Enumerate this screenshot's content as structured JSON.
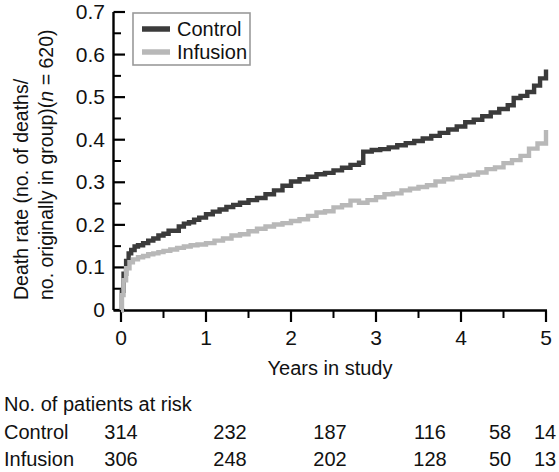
{
  "chart_data": {
    "type": "line",
    "title": "",
    "xlabel": "Years in study",
    "ylabel_line1": "Death rate (no. of deaths/",
    "ylabel_line2_a": "no. originally in group)(",
    "ylabel_line2_italic": "n",
    "ylabel_line2_b": " = 620)",
    "xlim": [
      0,
      5
    ],
    "ylim": [
      0,
      0.7
    ],
    "xticks": [
      0,
      1,
      2,
      3,
      4,
      5
    ],
    "xtick_labels": [
      "0",
      "1",
      "2",
      "3",
      "4",
      "5"
    ],
    "xticks_minor": [
      0.5,
      1.5,
      2.5,
      3.5,
      4.5
    ],
    "yticks": [
      0,
      0.1,
      0.2,
      0.3,
      0.4,
      0.5,
      0.6,
      0.7
    ],
    "ytick_labels": [
      "0",
      "0.1",
      "0.2",
      "0.3",
      "0.4",
      "0.5",
      "0.6",
      "0.7"
    ],
    "yticks_minor": [
      0.05,
      0.15,
      0.25,
      0.35,
      0.45,
      0.55,
      0.65
    ],
    "grid": false,
    "legend_position": "top-left",
    "series": [
      {
        "name": "Control",
        "color": "#3b3b3b",
        "line_width": 4.4,
        "x": [
          0,
          0.01,
          0.03,
          0.06,
          0.09,
          0.12,
          0.16,
          0.2,
          0.26,
          0.32,
          0.38,
          0.44,
          0.5,
          0.56,
          0.62,
          0.68,
          0.74,
          0.8,
          0.86,
          0.92,
          1.0,
          1.08,
          1.16,
          1.24,
          1.32,
          1.4,
          1.5,
          1.6,
          1.7,
          1.8,
          1.9,
          2.0,
          2.1,
          2.2,
          2.3,
          2.4,
          2.5,
          2.6,
          2.7,
          2.8,
          2.85,
          2.95,
          3.05,
          3.15,
          3.25,
          3.35,
          3.45,
          3.55,
          3.65,
          3.75,
          3.85,
          3.95,
          4.05,
          4.15,
          4.25,
          4.35,
          4.45,
          4.55,
          4.62,
          4.7,
          4.78,
          4.86,
          4.93,
          5.0
        ],
        "y": [
          0.0,
          0.045,
          0.085,
          0.115,
          0.133,
          0.141,
          0.149,
          0.152,
          0.157,
          0.163,
          0.168,
          0.175,
          0.179,
          0.186,
          0.186,
          0.196,
          0.203,
          0.206,
          0.212,
          0.217,
          0.225,
          0.231,
          0.236,
          0.242,
          0.247,
          0.252,
          0.258,
          0.263,
          0.272,
          0.281,
          0.292,
          0.302,
          0.307,
          0.313,
          0.319,
          0.322,
          0.328,
          0.334,
          0.341,
          0.346,
          0.372,
          0.376,
          0.378,
          0.382,
          0.387,
          0.392,
          0.397,
          0.403,
          0.409,
          0.416,
          0.424,
          0.431,
          0.441,
          0.447,
          0.455,
          0.464,
          0.472,
          0.481,
          0.498,
          0.503,
          0.512,
          0.527,
          0.544,
          0.565
        ]
      },
      {
        "name": "Infusion",
        "color": "#b8b8b8",
        "line_width": 4.4,
        "x": [
          0,
          0.01,
          0.03,
          0.06,
          0.1,
          0.14,
          0.2,
          0.26,
          0.32,
          0.38,
          0.44,
          0.5,
          0.58,
          0.66,
          0.74,
          0.82,
          0.9,
          1.0,
          1.1,
          1.2,
          1.3,
          1.4,
          1.5,
          1.6,
          1.7,
          1.8,
          1.9,
          2.0,
          2.1,
          2.2,
          2.3,
          2.4,
          2.5,
          2.6,
          2.7,
          2.8,
          2.9,
          3.0,
          3.1,
          3.2,
          3.3,
          3.4,
          3.5,
          3.6,
          3.7,
          3.8,
          3.9,
          4.0,
          4.1,
          4.2,
          4.3,
          4.4,
          4.5,
          4.6,
          4.7,
          4.8,
          4.9,
          5.0
        ],
        "y": [
          0.0,
          0.035,
          0.07,
          0.098,
          0.112,
          0.119,
          0.124,
          0.127,
          0.131,
          0.133,
          0.136,
          0.139,
          0.142,
          0.146,
          0.149,
          0.152,
          0.154,
          0.157,
          0.163,
          0.168,
          0.175,
          0.178,
          0.185,
          0.191,
          0.196,
          0.201,
          0.204,
          0.209,
          0.213,
          0.221,
          0.229,
          0.232,
          0.241,
          0.246,
          0.257,
          0.252,
          0.258,
          0.265,
          0.272,
          0.274,
          0.281,
          0.285,
          0.289,
          0.293,
          0.302,
          0.307,
          0.311,
          0.315,
          0.318,
          0.323,
          0.331,
          0.335,
          0.345,
          0.352,
          0.362,
          0.379,
          0.391,
          0.423
        ]
      }
    ]
  },
  "legend": {
    "items": [
      {
        "label": "Control"
      },
      {
        "label": "Infusion"
      }
    ]
  },
  "risk_table": {
    "header": "No. of patients at risk",
    "rows": [
      {
        "label": "Control",
        "values": [
          "314",
          "232",
          "187",
          "116",
          "58",
          "14"
        ]
      },
      {
        "label": "Infusion",
        "values": [
          "306",
          "248",
          "202",
          "128",
          "50",
          "13"
        ]
      }
    ]
  }
}
